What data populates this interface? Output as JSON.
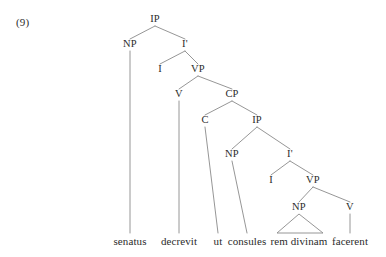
{
  "figure": {
    "example_number": "(9)",
    "language_note": "",
    "sentence_words": [
      "senatus",
      "decrevit",
      "ut",
      "consules",
      "rem divinam",
      "facerent"
    ]
  },
  "tree": {
    "nodes": [
      {
        "id": "IP1",
        "label": "IP",
        "x": 155,
        "y": 22
      },
      {
        "id": "NP1",
        "label": "NP",
        "x": 130,
        "y": 47
      },
      {
        "id": "Ibar1",
        "label": "I'",
        "x": 185,
        "y": 47
      },
      {
        "id": "I1",
        "label": "I",
        "x": 160,
        "y": 72
      },
      {
        "id": "VP1",
        "label": "VP",
        "x": 198,
        "y": 72
      },
      {
        "id": "V1",
        "label": "V",
        "x": 179,
        "y": 97
      },
      {
        "id": "CP1",
        "label": "CP",
        "x": 232,
        "y": 97
      },
      {
        "id": "C1",
        "label": "C",
        "x": 205,
        "y": 123
      },
      {
        "id": "IP2",
        "label": "IP",
        "x": 257,
        "y": 123
      },
      {
        "id": "NP2",
        "label": "NP",
        "x": 232,
        "y": 157
      },
      {
        "id": "Ibar2",
        "label": "I'",
        "x": 290,
        "y": 157
      },
      {
        "id": "I2",
        "label": "I",
        "x": 271,
        "y": 183
      },
      {
        "id": "VP2",
        "label": "VP",
        "x": 313,
        "y": 183
      },
      {
        "id": "NP3",
        "label": "NP",
        "x": 299,
        "y": 210
      },
      {
        "id": "V2",
        "label": "V",
        "x": 350,
        "y": 210
      }
    ],
    "edges": [
      [
        "IP1",
        "NP1"
      ],
      [
        "IP1",
        "Ibar1"
      ],
      [
        "Ibar1",
        "I1"
      ],
      [
        "Ibar1",
        "VP1"
      ],
      [
        "VP1",
        "V1"
      ],
      [
        "VP1",
        "CP1"
      ],
      [
        "CP1",
        "C1"
      ],
      [
        "CP1",
        "IP2"
      ],
      [
        "IP2",
        "NP2"
      ],
      [
        "IP2",
        "Ibar2"
      ],
      [
        "Ibar2",
        "I2"
      ],
      [
        "Ibar2",
        "VP2"
      ],
      [
        "VP2",
        "NP3"
      ],
      [
        "VP2",
        "V2"
      ]
    ],
    "terminals": [
      {
        "id": "t-senatus",
        "word": "senatus",
        "x": 130,
        "y": 245,
        "from": "NP1",
        "style": "stem"
      },
      {
        "id": "t-decrevit",
        "word": "decrevit",
        "x": 179,
        "y": 245,
        "from": "V1",
        "style": "stem"
      },
      {
        "id": "t-ut",
        "word": "ut",
        "x": 218,
        "y": 245,
        "from": "C1",
        "style": "stem"
      },
      {
        "id": "t-consules",
        "word": "consules",
        "x": 247,
        "y": 245,
        "from": "NP2",
        "style": "stem"
      },
      {
        "id": "t-remdivinam",
        "word": "rem divinam",
        "x": 299,
        "y": 245,
        "from": "NP3",
        "style": "triangle",
        "base_left": 277,
        "base_right": 323
      },
      {
        "id": "t-facerent",
        "word": "facerent",
        "x": 350,
        "y": 245,
        "from": "V2",
        "style": "stem"
      }
    ],
    "geometry": {
      "label_gap_below": 4,
      "label_gap_above": 8,
      "terminal_top": 233
    },
    "colors": {
      "line": "#8a8a8a",
      "text": "#2b2b2b",
      "background": "#ffffff"
    }
  }
}
